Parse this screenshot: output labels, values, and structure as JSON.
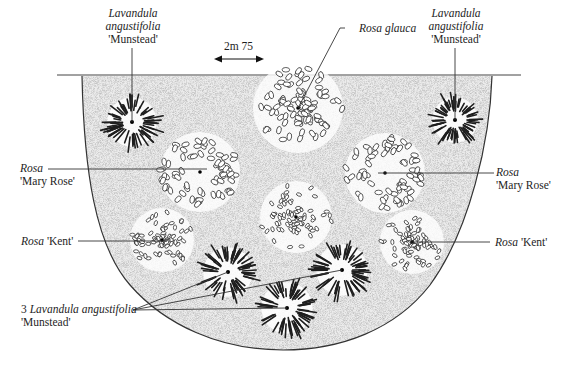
{
  "diagram": {
    "type": "planting-plan",
    "shape": "semicircular border bed",
    "scale": {
      "label": "2m 75",
      "arrow": "double-headed"
    },
    "colors": {
      "ink": "#1e1e1e",
      "bed_fill": "#e6e6e6",
      "background": "#ffffff"
    }
  },
  "labels": {
    "lav_top_left": {
      "genus": "Lavandula",
      "species": "angustifolia",
      "cultivar": "'Munstead'"
    },
    "rosa_glauca": {
      "genus": "Rosa",
      "species": "glauca"
    },
    "lav_top_right": {
      "genus": "Lavandula",
      "species": "angustifolia",
      "cultivar": "'Munstead'"
    },
    "mary_rose_left": {
      "genus": "Rosa",
      "cultivar": "'Mary Rose'"
    },
    "mary_rose_right": {
      "genus": "Rosa",
      "cultivar": "'Mary Rose'"
    },
    "kent_left": {
      "genus": "Rosa",
      "cultivar": "'Kent'"
    },
    "kent_right": {
      "genus": "Rosa",
      "cultivar": "'Kent'"
    },
    "lav_group": {
      "count": "3",
      "genus": "Lavandula",
      "species": "angustifolia",
      "cultivar": "'Munstead'"
    }
  },
  "plants": [
    {
      "id": "lavender-1",
      "kind": "lavender",
      "x": 132,
      "y": 122,
      "r": 26
    },
    {
      "id": "lavender-2",
      "kind": "lavender",
      "x": 455,
      "y": 120,
      "r": 24
    },
    {
      "id": "rosa-glauca",
      "kind": "rose-large",
      "x": 298,
      "y": 108,
      "r": 45
    },
    {
      "id": "mary-rose-left",
      "kind": "rose-ring",
      "x": 200,
      "y": 172,
      "r": 40
    },
    {
      "id": "mary-rose-right",
      "kind": "rose-ring",
      "x": 385,
      "y": 173,
      "r": 40
    },
    {
      "id": "rose-centre",
      "kind": "rose-small",
      "x": 296,
      "y": 217,
      "r": 36
    },
    {
      "id": "kent-left",
      "kind": "rose-small",
      "x": 162,
      "y": 240,
      "r": 32
    },
    {
      "id": "kent-right",
      "kind": "rose-small",
      "x": 412,
      "y": 242,
      "r": 32
    },
    {
      "id": "lavender-3",
      "kind": "lavender",
      "x": 228,
      "y": 272,
      "r": 26
    },
    {
      "id": "lavender-4",
      "kind": "lavender",
      "x": 342,
      "y": 270,
      "r": 27
    },
    {
      "id": "lavender-5",
      "kind": "lavender",
      "x": 287,
      "y": 308,
      "r": 27
    }
  ]
}
